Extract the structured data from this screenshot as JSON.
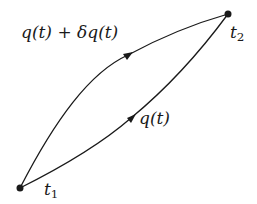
{
  "diagram": {
    "type": "variational-paths",
    "endpoints": [
      {
        "id": "t1",
        "label": "t",
        "subscript": "1",
        "x": 20,
        "y": 188
      },
      {
        "id": "t2",
        "label": "t",
        "subscript": "2",
        "x": 228,
        "y": 14
      }
    ],
    "paths": [
      {
        "id": "varied-path",
        "label": "q(t) + δq(t)",
        "curvature": "upper"
      },
      {
        "id": "true-path",
        "label": "q(t)",
        "curvature": "lower"
      }
    ],
    "colors": {
      "stroke": "#1a1a1a",
      "background": "#ffffff"
    }
  },
  "labels": {
    "varied_path": "q(t) + δq(t)",
    "true_path": "q(t)",
    "t1_base": "t",
    "t1_sub": "1",
    "t2_base": "t",
    "t2_sub": "2"
  }
}
